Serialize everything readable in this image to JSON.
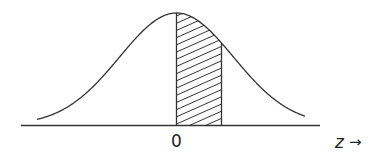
{
  "diagram": {
    "type": "normal-distribution",
    "center_label": "0",
    "axis_label": "z",
    "axis_arrow": "→",
    "shaded_region": {
      "from": "0",
      "to": "z",
      "pattern": "diagonal-hatch"
    },
    "colors": {
      "stroke": "#333333",
      "background": "#ffffff"
    }
  }
}
